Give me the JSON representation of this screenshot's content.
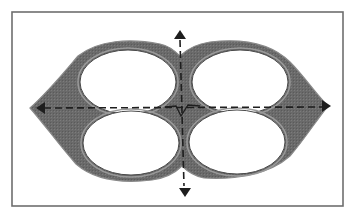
{
  "diagram": {
    "colors": {
      "background": "#ffffff",
      "frame": "#6e6e6e",
      "body_fill": "#6a6a6a",
      "body_edge": "#8a8a8a",
      "hole_fill": "#ffffff",
      "axis": "#1e1e1e"
    },
    "frame": {
      "x": 12,
      "y": 12,
      "width": 331,
      "height": 194
    },
    "body_path": "M 30 108 C 48 92, 66 70, 78 56 C 98 40, 130 38, 160 44 C 170 46, 176 52, 180 56 C 186 50, 196 44, 210 42 C 244 38, 272 44, 290 62 C 304 76, 316 94, 328 106 C 318 118, 304 140, 290 156 C 270 174, 236 180, 204 178 C 194 176, 186 170, 182 166 C 176 172, 166 178, 152 180 C 118 184, 92 178, 76 164 C 60 146, 44 124, 30 108 Z",
    "holes": [
      {
        "name": "top-left",
        "cx": 128,
        "cy": 82,
        "rx": 48,
        "ry": 32
      },
      {
        "name": "top-right",
        "cx": 240,
        "cy": 82,
        "rx": 48,
        "ry": 32
      },
      {
        "name": "bottom-left",
        "cx": 131,
        "cy": 143,
        "rx": 48,
        "ry": 32
      },
      {
        "name": "bottom-right",
        "cx": 237,
        "cy": 142,
        "rx": 48,
        "ry": 32
      }
    ],
    "axes": {
      "horizontal": {
        "x1": 44,
        "y1": 108,
        "x2": 322,
        "y2": 107,
        "arrow_left": [
          36,
          108
        ],
        "arrow_right": [
          331,
          106
        ]
      },
      "vertical": {
        "x1": 180,
        "y1": 40,
        "x2": 184,
        "y2": 186,
        "arrow_top": [
          180,
          30
        ],
        "arrow_bottom": [
          185,
          197
        ]
      },
      "center_kink": "M 165 107 L 176 106 L 181 116 L 188 105 L 200 106"
    }
  }
}
